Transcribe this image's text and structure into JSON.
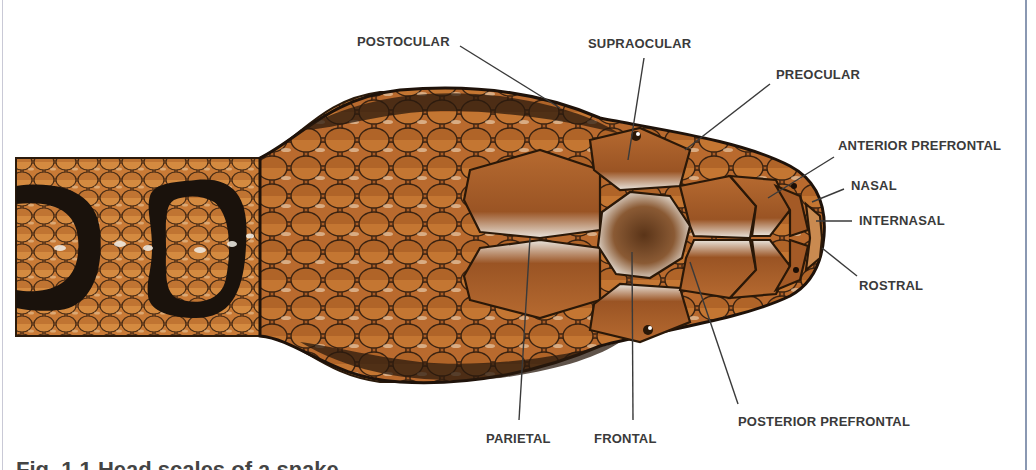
{
  "figure": {
    "caption_partial": "Fig. 1.1 — Head scales of a snake",
    "colors": {
      "background": "#ffffff",
      "scale_base": "#b86a2e",
      "scale_light": "#e2a04a",
      "scale_edge": "#3a2412",
      "band": "#1a120c",
      "leader_line": "#3a3a3a",
      "label_text": "#3a3a3a",
      "frame_rule": "#8a98b2"
    }
  },
  "labels": [
    {
      "id": "postocular",
      "text": "POSTOCULAR",
      "x": 357,
      "y": 34,
      "line": [
        460,
        46,
        560,
        108
      ]
    },
    {
      "id": "supraocular",
      "text": "SUPRAOCULAR",
      "x": 588,
      "y": 36,
      "line": [
        644,
        58,
        628,
        160
      ]
    },
    {
      "id": "preocular",
      "text": "PREOCULAR",
      "x": 776,
      "y": 67,
      "line": [
        770,
        84,
        685,
        150
      ]
    },
    {
      "id": "anterior-prefrontal",
      "text": "ANTERIOR PREFRONTAL",
      "x": 838,
      "y": 138,
      "line": [
        834,
        157,
        768,
        198
      ]
    },
    {
      "id": "nasal",
      "text": "NASAL",
      "x": 851,
      "y": 178,
      "line": [
        844,
        189,
        812,
        202
      ]
    },
    {
      "id": "internasal",
      "text": "INTERNASAL",
      "x": 859,
      "y": 213,
      "line": [
        852,
        221,
        816,
        221
      ]
    },
    {
      "id": "rostral",
      "text": "ROSTRAL",
      "x": 859,
      "y": 278,
      "line": [
        857,
        276,
        822,
        248
      ]
    },
    {
      "id": "parietal",
      "text": "PARIETAL",
      "x": 486,
      "y": 431,
      "line": [
        519,
        420,
        530,
        238
      ]
    },
    {
      "id": "frontal",
      "text": "FRONTAL",
      "x": 594,
      "y": 431,
      "line": [
        633,
        420,
        632,
        252
      ]
    },
    {
      "id": "posterior-prefrontal",
      "text": "POSTERIOR PREFRONTAL",
      "x": 738,
      "y": 414,
      "line": [
        738,
        404,
        690,
        262
      ]
    }
  ],
  "caption": {
    "text": "Fig. 1.1   Head scales of a snake"
  }
}
